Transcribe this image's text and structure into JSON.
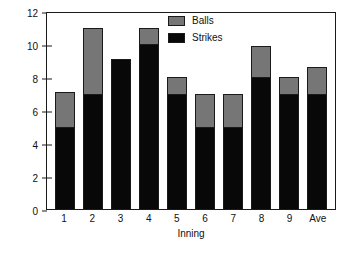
{
  "chart_data": {
    "type": "bar",
    "stacked": true,
    "title": "",
    "xlabel": "Inning",
    "ylabel": "Pitches",
    "categories": [
      "1",
      "2",
      "3",
      "4",
      "5",
      "6",
      "7",
      "8",
      "9",
      "Ave"
    ],
    "series": [
      {
        "name": "Strikes",
        "color": "#080808",
        "values": [
          5,
          7,
          9.1,
          10,
          7,
          5,
          5,
          8,
          7,
          7
        ]
      },
      {
        "name": "Balls",
        "color": "#767676",
        "values": [
          2.1,
          4,
          0,
          1,
          1,
          2,
          2,
          1.9,
          1,
          1.6
        ]
      }
    ],
    "totals": [
      7.1,
      11,
      9.1,
      11,
      8,
      7,
      7,
      9.9,
      8,
      8.6
    ],
    "ylim": [
      0,
      12
    ],
    "yticks": [
      0,
      2,
      4,
      6,
      8,
      10,
      12
    ],
    "grid": false,
    "legend_position": "top-center",
    "legend": [
      "Balls",
      "Strikes"
    ]
  },
  "legend": {
    "entries": [
      {
        "label": "Balls",
        "color": "#767676"
      },
      {
        "label": "Strikes",
        "color": "#080808"
      }
    ]
  },
  "axes": {
    "y_title": "Pitches",
    "x_title": "Inning"
  },
  "colors": {
    "balls": "#767676",
    "strikes": "#080808",
    "axis": "#1a1a1a",
    "background": "#ffffff"
  }
}
